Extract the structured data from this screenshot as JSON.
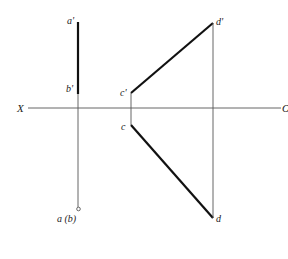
{
  "diagram": {
    "type": "orthographic-projection",
    "axis": {
      "left_label": "X",
      "right_label": "O",
      "y": 108,
      "x1": 28,
      "x2": 281
    },
    "colors": {
      "thick_line": "#111111",
      "thin_line": "#555555",
      "background": "#ffffff"
    },
    "points": {
      "a_prime": {
        "label": "a'",
        "x": 78,
        "y": 22
      },
      "b_prime": {
        "label": "b'",
        "x": 78,
        "y": 94
      },
      "ab": {
        "label": "a (b)",
        "x": 78,
        "y": 209
      },
      "c_prime": {
        "label": "c'",
        "x": 131,
        "y": 93
      },
      "c": {
        "label": "c",
        "x": 131,
        "y": 125
      },
      "d_prime": {
        "label": "d'",
        "x": 213,
        "y": 23
      },
      "d": {
        "label": "d",
        "x": 213,
        "y": 218
      }
    },
    "segments": [
      {
        "name": "a'b'",
        "from": "a_prime",
        "to": "b_prime",
        "style": "thick"
      },
      {
        "name": "c'd'",
        "from": "c_prime",
        "to": "d_prime",
        "style": "thick"
      },
      {
        "name": "cd",
        "from": "c",
        "to": "d",
        "style": "thick"
      },
      {
        "name": "projector-ab",
        "from": "b_prime",
        "to": "ab",
        "style": "thin"
      },
      {
        "name": "projector-c",
        "from": "c_prime",
        "to": "c",
        "style": "thin"
      },
      {
        "name": "projector-d",
        "from": "d_prime",
        "to": "d",
        "style": "thin"
      }
    ]
  }
}
